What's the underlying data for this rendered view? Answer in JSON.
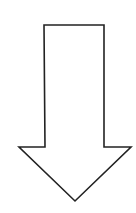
{
  "diagram": {
    "shape": "down-arrow",
    "icon": "arrow-down-icon",
    "stroke_color": "#222222",
    "fill_color": "#ffffff",
    "background": "#ffffff"
  }
}
